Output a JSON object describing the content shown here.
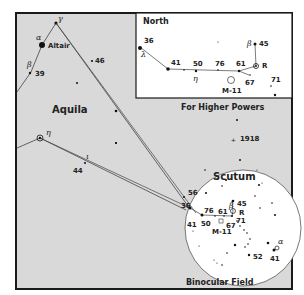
{
  "chart": {
    "constellation_label": "Aquila",
    "inset": {
      "corner_label": "North",
      "caption": "For Higher Powers",
      "star_labels": [
        "36",
        "41",
        "50",
        "76",
        "61",
        "67",
        "71",
        "45"
      ],
      "greek": {
        "lambda": "λ",
        "eta": "η",
        "beta": "β"
      },
      "variable_label": "R",
      "cluster_label": "M-11"
    },
    "main_star_labels": {
      "altair": "Altair",
      "alpha": "α",
      "gamma": "γ",
      "beta": "β",
      "eta": "η",
      "iota": "ι",
      "s39": "39",
      "s46": "46",
      "s44": "44",
      "nova": "1918"
    },
    "binocular": {
      "title": "Scutum",
      "caption": "Binocular Field",
      "star_labels": [
        "56",
        "36",
        "76",
        "61",
        "45",
        "41",
        "50",
        "67",
        "71",
        "52",
        "41"
      ],
      "beta": "β",
      "alpha": "α",
      "variable_label": "R",
      "cluster_label": "M-11"
    },
    "colors": {
      "background": "#d9d9d9",
      "frame": "#1a1a1a",
      "inset_fill": "#ffffff",
      "circle_fill": "#ffffff",
      "lines": "#333333"
    }
  }
}
